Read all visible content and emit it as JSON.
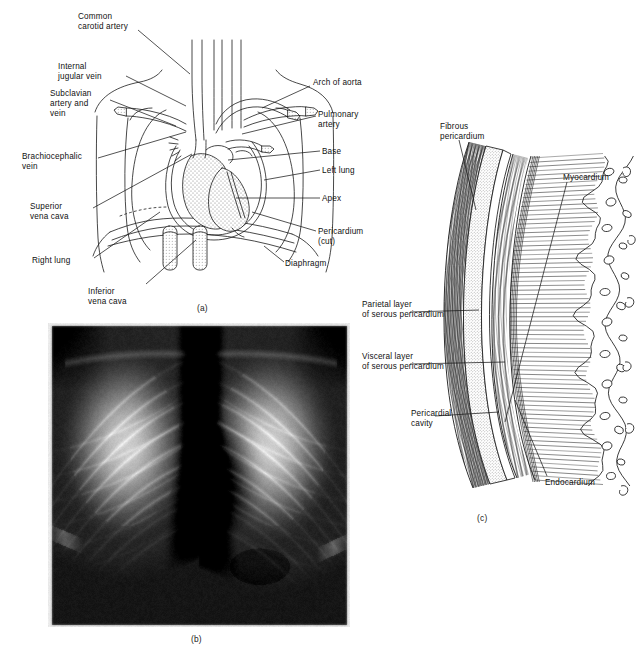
{
  "figure": {
    "panels": [
      {
        "id": "a",
        "caption": "(a)",
        "description": "Anterior view of the heart and great vessels within the thorax, pericardium cut open"
      },
      {
        "id": "b",
        "caption": "(b)",
        "description": "Posteroanterior chest radiograph"
      },
      {
        "id": "c",
        "caption": "(c)",
        "description": "Cross section through the wall of the heart showing pericardial layers"
      }
    ]
  },
  "panel_a": {
    "caption": "(a)",
    "labels_left": [
      {
        "key": "common_carotid_artery",
        "lines": [
          "Common",
          "carotid artery"
        ],
        "x": 78,
        "y": 12
      },
      {
        "key": "internal_jugular_vein",
        "lines": [
          "Internal",
          "jugular vein"
        ],
        "x": 58,
        "y": 62
      },
      {
        "key": "subclavian_artery_and_vein",
        "lines": [
          "Subclavian",
          "artery and",
          "vein"
        ],
        "x": 50,
        "y": 89
      },
      {
        "key": "brachiocephalic_vein",
        "lines": [
          "Brachiocephalic",
          "vein"
        ],
        "x": 22,
        "y": 152
      },
      {
        "key": "superior_vena_cava",
        "lines": [
          "Superior",
          "vena cava"
        ],
        "x": 30,
        "y": 202
      },
      {
        "key": "right_lung",
        "lines": [
          "Right lung"
        ],
        "x": 32,
        "y": 256
      },
      {
        "key": "inferior_vena_cava",
        "lines": [
          "Inferior",
          "vena cava"
        ],
        "x": 88,
        "y": 287
      }
    ],
    "labels_right": [
      {
        "key": "arch_of_aorta",
        "lines": [
          "Arch of aorta"
        ],
        "x": 313,
        "y": 82
      },
      {
        "key": "pulmonary_artery",
        "lines": [
          "Pulmonary",
          "artery"
        ],
        "x": 318,
        "y": 113
      },
      {
        "key": "base",
        "lines": [
          "Base"
        ],
        "x": 322,
        "y": 148
      },
      {
        "key": "left_lung",
        "lines": [
          "Left lung"
        ],
        "x": 322,
        "y": 167
      },
      {
        "key": "apex",
        "lines": [
          "Apex"
        ],
        "x": 322,
        "y": 195
      },
      {
        "key": "pericardium_cut",
        "lines": [
          "Pericardium",
          "(cut)"
        ],
        "x": 318,
        "y": 228
      },
      {
        "key": "diaphragm",
        "lines": [
          "Diaphragm"
        ],
        "x": 285,
        "y": 260
      }
    ]
  },
  "panel_b": {
    "caption": "(b)",
    "image_kind": "chest-radiograph",
    "alt": "Posteroanterior chest x-ray showing lungs, ribs, spine, heart shadow and diaphragm"
  },
  "panel_c": {
    "caption": "(c)",
    "labels": [
      {
        "key": "fibrous_pericardium",
        "lines": [
          "Fibrous",
          "pericardium"
        ],
        "x": 440,
        "y": 127,
        "align": "left"
      },
      {
        "key": "myocardium",
        "lines": [
          "Myocardium"
        ],
        "x": 563,
        "y": 170,
        "align": "left"
      },
      {
        "key": "parietal_layer_of_serous_pericardium",
        "lines": [
          "Parietal layer",
          "of serous pericardium"
        ],
        "x": 362,
        "y": 302,
        "align": "left"
      },
      {
        "key": "visceral_layer_of_serous_pericardium",
        "lines": [
          "Visceral layer",
          "of serous pericardium"
        ],
        "x": 362,
        "y": 354,
        "align": "left"
      },
      {
        "key": "pericardial_cavity",
        "lines": [
          "Pericardial",
          "cavity"
        ],
        "x": 411,
        "y": 411,
        "align": "left"
      },
      {
        "key": "endocardium",
        "lines": [
          "Endocardium"
        ],
        "x": 545,
        "y": 480,
        "align": "left"
      }
    ]
  },
  "colors": {
    "background": "#ffffff",
    "ink": "#111111",
    "line": "#1a1a1a",
    "stipple": "#6b6b6b",
    "xray_dark": "#1c1c1c",
    "xray_light": "#e8e8e8"
  }
}
